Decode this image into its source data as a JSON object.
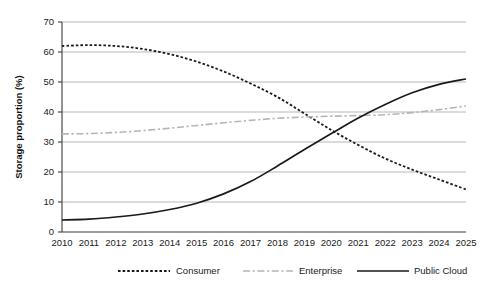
{
  "chart_data": {
    "type": "line",
    "title": "",
    "xlabel": "",
    "ylabel": "Storage proportion (%)",
    "xlim": [
      2010,
      2025
    ],
    "ylim": [
      0,
      70
    ],
    "ytick_step": 10,
    "grid": true,
    "legend_position": "bottom",
    "x": [
      2010,
      2011,
      2012,
      2013,
      2014,
      2015,
      2016,
      2017,
      2018,
      2019,
      2020,
      2021,
      2022,
      2023,
      2024,
      2025
    ],
    "categories": [
      "2010",
      "2011",
      "2012",
      "2013",
      "2014",
      "2015",
      "2016",
      "2017",
      "2018",
      "2019",
      "2020",
      "2021",
      "2022",
      "2023",
      "2024",
      "2025"
    ],
    "yticks": [
      "0",
      "10",
      "20",
      "30",
      "40",
      "50",
      "60",
      "70"
    ],
    "series": [
      {
        "name": "Consumer",
        "style": "dotted",
        "color": "#1a1a1a",
        "values": [
          62.0,
          62.3,
          62.0,
          61.0,
          59.3,
          56.8,
          53.5,
          49.5,
          45.0,
          39.5,
          34.0,
          29.0,
          24.5,
          20.8,
          17.5,
          14.2
        ]
      },
      {
        "name": "Enterprise",
        "style": "dash-dot",
        "color": "#b5b5b5",
        "values": [
          32.7,
          32.8,
          33.2,
          33.8,
          34.6,
          35.5,
          36.4,
          37.2,
          37.9,
          38.3,
          38.6,
          38.8,
          39.1,
          39.8,
          40.8,
          42.0
        ]
      },
      {
        "name": "Public Cloud",
        "style": "solid",
        "color": "#1a1a1a",
        "values": [
          4.0,
          4.3,
          5.0,
          6.0,
          7.5,
          9.6,
          12.7,
          16.8,
          22.0,
          27.5,
          32.8,
          38.0,
          42.5,
          46.4,
          49.2,
          51.0
        ]
      }
    ]
  },
  "legend": {
    "items": [
      {
        "label": "Consumer"
      },
      {
        "label": "Enterprise"
      },
      {
        "label": "Public Cloud"
      }
    ]
  }
}
